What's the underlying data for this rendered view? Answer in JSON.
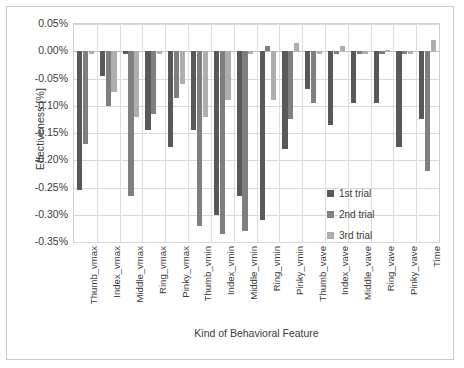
{
  "chart_data": {
    "type": "bar",
    "title": "",
    "xlabel": "Kind of Behavioral Feature",
    "ylabel": "Effectiveness [%]",
    "ylim": [
      -0.35,
      0.05
    ],
    "ytick_step": 0.05,
    "ytick_labels": [
      "0.05%",
      "0.00%",
      "-0.05%",
      "-0.10%",
      "-0.15%",
      "-0.20%",
      "-0.25%",
      "-0.30%",
      "-0.35%"
    ],
    "ytick_values": [
      0.05,
      0.0,
      -0.05,
      -0.1,
      -0.15,
      -0.2,
      -0.25,
      -0.3,
      -0.35
    ],
    "grid": true,
    "legend_position": "inside-right",
    "units": "%",
    "categories": [
      "Thumb_vmax",
      "Index_vmax",
      "Middle_vmax",
      "Ring_vmax",
      "Pinky_vmax",
      "Thumb_vmin",
      "Index_vmin",
      "Middle_vmin",
      "Ring_vmin",
      "Pinky_vmin",
      "Thumb_vave",
      "Index_vave",
      "Middle_vave",
      "Ring_vave",
      "Pinky_vave",
      "Time"
    ],
    "series": [
      {
        "name": "1st trial",
        "color": "#595959",
        "values": [
          -0.255,
          -0.045,
          -0.005,
          -0.145,
          -0.175,
          -0.145,
          -0.3,
          -0.265,
          -0.31,
          -0.18,
          -0.07,
          -0.135,
          -0.095,
          -0.095,
          -0.175,
          -0.125
        ]
      },
      {
        "name": "2nd trial",
        "color": "#7f7f7f",
        "values": [
          -0.17,
          -0.1,
          -0.265,
          -0.115,
          -0.085,
          -0.32,
          -0.335,
          -0.33,
          0.01,
          -0.125,
          -0.095,
          -0.005,
          -0.005,
          -0.005,
          -0.005,
          -0.22
        ]
      },
      {
        "name": "3rd trial",
        "color": "#aeaeae",
        "values": [
          -0.005,
          -0.075,
          -0.12,
          -0.005,
          -0.06,
          -0.12,
          -0.09,
          -0.005,
          -0.09,
          0.015,
          -0.005,
          0.01,
          -0.005,
          0.003,
          -0.005,
          0.02
        ]
      }
    ]
  },
  "legend": {
    "items": [
      {
        "label": "1st trial",
        "color": "#595959"
      },
      {
        "label": "2nd trial",
        "color": "#7f7f7f"
      },
      {
        "label": "3rd trial",
        "color": "#aeaeae"
      }
    ]
  }
}
